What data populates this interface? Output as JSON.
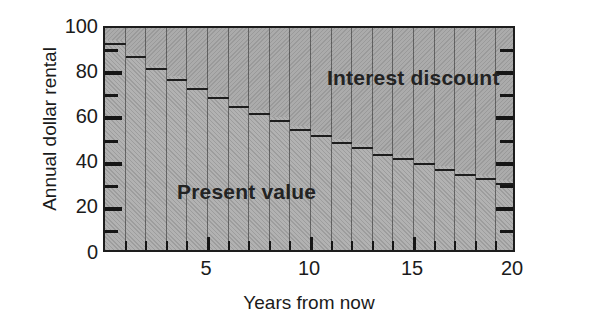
{
  "chart_data": {
    "type": "bar",
    "title": "",
    "subtitle": "",
    "xlabel": "Years from now",
    "ylabel": "Annual dollar rental",
    "xlim": [
      0,
      20
    ],
    "ylim": [
      0,
      100
    ],
    "grid": false,
    "stacked": true,
    "legend_position": "inside-plot",
    "x_tick_labels": [
      "5",
      "10",
      "15",
      "20"
    ],
    "x_tick_values": [
      5,
      10,
      15,
      20
    ],
    "y_tick_labels": [
      "0",
      "20",
      "40",
      "60",
      "80",
      "100"
    ],
    "y_tick_values": [
      0,
      20,
      40,
      60,
      80,
      100
    ],
    "y_minor_tick_values": [
      10,
      30,
      50,
      70,
      90
    ],
    "categories": [
      1,
      2,
      3,
      4,
      5,
      6,
      7,
      8,
      9,
      10,
      11,
      12,
      13,
      14,
      15,
      16,
      17,
      18,
      19,
      20
    ],
    "series": [
      {
        "name": "Present value",
        "values": [
          93,
          87,
          82,
          77,
          73,
          69,
          65,
          62,
          59,
          55,
          52,
          49,
          47,
          44,
          42,
          40,
          37,
          35,
          33,
          31
        ]
      },
      {
        "name": "Interest discount",
        "values": [
          7,
          13,
          18,
          23,
          27,
          31,
          35,
          38,
          41,
          45,
          48,
          51,
          53,
          56,
          58,
          60,
          63,
          65,
          67,
          69
        ]
      }
    ],
    "total_per_bar": 100,
    "annotations": [
      {
        "text": "Interest discount",
        "x": 12,
        "y": 84
      },
      {
        "text": "Present value",
        "x": 5,
        "y": 33
      }
    ]
  },
  "axes": {
    "y_title": "Annual dollar rental",
    "x_title": "Years from now"
  },
  "labels": {
    "interest_discount": "Interest discount",
    "present_value": "Present value"
  },
  "colors": {
    "fill": "#aeaeae",
    "line": "#1d1d1d",
    "text": "#1b1b1b",
    "background": "#ffffff"
  }
}
